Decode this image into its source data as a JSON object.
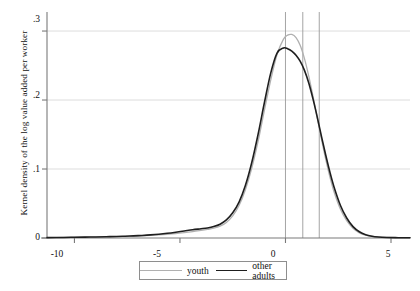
{
  "chart_data": {
    "type": "line",
    "title": "",
    "subtitle": "",
    "xlabel": "",
    "ylabel": "Kernel density of the log value added per worker",
    "xlim": [
      -11.3,
      5.9
    ],
    "ylim": [
      0,
      0.316
    ],
    "grid": true,
    "grid_axis": "y",
    "legend_position": "bottom",
    "x_ticks": [
      -10,
      -5,
      0,
      5
    ],
    "x_tick_labels": [
      "-10",
      "-5",
      "0",
      "5"
    ],
    "y_ticks": [
      0,
      0.1,
      0.2,
      0.3
    ],
    "y_tick_labels": [
      "0",
      ".1",
      ".2",
      ".3"
    ],
    "colors": {
      "youth": "#b0b0b0",
      "other_adults": "#1e1e1e",
      "grid": "#d4d4d4",
      "axis": "#7a7a7a",
      "vline": "#9a9a9a"
    },
    "annotations": [
      {
        "name": "vertical-reference-line-1",
        "type": "vline",
        "x": 0.0
      },
      {
        "name": "vertical-reference-line-2",
        "type": "vline",
        "x": 0.82
      },
      {
        "name": "vertical-reference-line-3",
        "type": "vline",
        "x": 1.6
      }
    ],
    "series": [
      {
        "name": "youth",
        "label": "youth",
        "color": "#b0b0b0",
        "width": 1.3,
        "x": [
          -11.3,
          -10.5,
          -10.0,
          -9.5,
          -9.0,
          -8.5,
          -8.0,
          -7.6,
          -7.2,
          -6.8,
          -6.4,
          -6.0,
          -5.6,
          -5.2,
          -4.8,
          -4.4,
          -4.0,
          -3.7,
          -3.4,
          -3.1,
          -2.8,
          -2.5,
          -2.2,
          -1.9,
          -1.6,
          -1.3,
          -1.0,
          -0.7,
          -0.4,
          -0.1,
          0.1,
          0.3,
          0.5,
          0.7,
          0.9,
          1.1,
          1.3,
          1.5,
          1.7,
          1.9,
          2.1,
          2.3,
          2.6,
          2.9,
          3.2,
          3.5,
          3.8,
          4.1,
          4.4,
          4.8,
          5.2,
          5.6,
          5.9
        ],
        "y": [
          0.0005,
          0.0008,
          0.001,
          0.0012,
          0.0014,
          0.0016,
          0.0019,
          0.0022,
          0.0026,
          0.0031,
          0.0037,
          0.0044,
          0.0053,
          0.0064,
          0.0078,
          0.0094,
          0.011,
          0.0124,
          0.0142,
          0.0172,
          0.0226,
          0.032,
          0.047,
          0.07,
          0.101,
          0.14,
          0.185,
          0.229,
          0.266,
          0.288,
          0.294,
          0.295,
          0.2905,
          0.279,
          0.26,
          0.235,
          0.206,
          0.175,
          0.144,
          0.115,
          0.089,
          0.067,
          0.042,
          0.025,
          0.014,
          0.0075,
          0.004,
          0.0022,
          0.0014,
          0.0008,
          0.0005,
          0.0004,
          0.0003
        ]
      },
      {
        "name": "other_adults",
        "label": "other adults",
        "color": "#1e1e1e",
        "width": 1.6,
        "x": [
          -11.3,
          -10.5,
          -10.0,
          -9.5,
          -9.0,
          -8.5,
          -8.0,
          -7.6,
          -7.2,
          -6.8,
          -6.4,
          -6.0,
          -5.6,
          -5.2,
          -4.8,
          -4.4,
          -4.0,
          -3.7,
          -3.4,
          -3.1,
          -2.8,
          -2.5,
          -2.2,
          -1.9,
          -1.6,
          -1.3,
          -1.0,
          -0.7,
          -0.4,
          -0.1,
          0.1,
          0.3,
          0.5,
          0.7,
          0.9,
          1.1,
          1.3,
          1.5,
          1.7,
          1.9,
          2.1,
          2.3,
          2.6,
          2.9,
          3.2,
          3.5,
          3.8,
          4.1,
          4.4,
          4.8,
          5.2,
          5.6,
          5.9
        ],
        "y": [
          0.0005,
          0.0008,
          0.0011,
          0.0013,
          0.0015,
          0.0018,
          0.0022,
          0.0026,
          0.0031,
          0.0037,
          0.0045,
          0.0055,
          0.0068,
          0.0084,
          0.0102,
          0.012,
          0.0134,
          0.0146,
          0.0166,
          0.02,
          0.0262,
          0.0365,
          0.052,
          0.076,
          0.109,
          0.15,
          0.196,
          0.239,
          0.268,
          0.2755,
          0.2745,
          0.271,
          0.265,
          0.256,
          0.243,
          0.225,
          0.202,
          0.176,
          0.148,
          0.121,
          0.096,
          0.074,
          0.0475,
          0.029,
          0.0165,
          0.009,
          0.0048,
          0.0026,
          0.0015,
          0.0008,
          0.0005,
          0.0004,
          0.0003
        ]
      }
    ]
  },
  "legend": {
    "items": [
      {
        "label": "youth",
        "color": "#b0b0b0",
        "width": "1.3px"
      },
      {
        "label": "other adults",
        "color": "#1e1e1e",
        "width": "1.8px"
      }
    ]
  }
}
